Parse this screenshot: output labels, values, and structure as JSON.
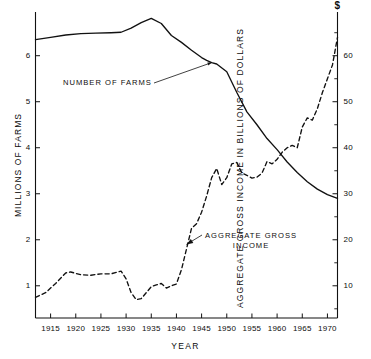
{
  "chart_data": {
    "type": "line",
    "title": "",
    "subtitle": "",
    "xlabel": "YEAR",
    "ylabel": "MILLIONS OF FARMS",
    "ylabel_right": "AGGREGATE GROSS INCOME IN BILLIONS OF DOLLARS",
    "right_axis_unit_symbol": "$",
    "grid": false,
    "legend_position": "inline-annotations",
    "xlim": [
      1912,
      1972
    ],
    "ylim": [
      0.3,
      6.95
    ],
    "ylim_right": [
      3.0,
      69.5
    ],
    "xticks": [
      1915,
      1920,
      1925,
      1930,
      1935,
      1940,
      1945,
      1950,
      1955,
      1960,
      1965,
      1970
    ],
    "xtick_labels": [
      "1915",
      "1920",
      "1925",
      "1930",
      "1935",
      "1940",
      "1945",
      "1950",
      "1955",
      "1960",
      "1965",
      "1970"
    ],
    "yticks_left": [
      1,
      2,
      3,
      4,
      5,
      6
    ],
    "ytick_labels_left": [
      "1",
      "2",
      "3",
      "4",
      "5",
      "6"
    ],
    "yticks_right": [
      10,
      20,
      30,
      40,
      50,
      60
    ],
    "ytick_labels_right": [
      "10",
      "20",
      "30",
      "40",
      "50",
      "60"
    ],
    "yticks_right_minor": [
      5,
      15,
      25,
      35,
      45,
      55,
      65
    ],
    "series": [
      {
        "name": "NUMBER OF FARMS",
        "axis": "left",
        "style": "solid",
        "color": "#111111",
        "x": [
          1912,
          1915,
          1918,
          1921,
          1924,
          1927,
          1929,
          1931,
          1933,
          1935,
          1937,
          1939,
          1941,
          1943,
          1945,
          1946,
          1947,
          1948,
          1950,
          1952,
          1954,
          1956,
          1958,
          1960,
          1962,
          1964,
          1966,
          1968,
          1970,
          1972
        ],
        "y": [
          6.35,
          6.4,
          6.45,
          6.48,
          6.49,
          6.5,
          6.51,
          6.6,
          6.72,
          6.81,
          6.7,
          6.44,
          6.29,
          6.12,
          5.96,
          5.9,
          5.85,
          5.82,
          5.65,
          5.2,
          4.78,
          4.5,
          4.2,
          3.96,
          3.69,
          3.46,
          3.26,
          3.1,
          2.98,
          2.9
        ]
      },
      {
        "name": "AGGREGATE GROSS INCOME",
        "axis": "right",
        "style": "dashed",
        "color": "#111111",
        "x": [
          1912,
          1914,
          1916,
          1918,
          1919,
          1921,
          1923,
          1925,
          1927,
          1929,
          1930,
          1931,
          1932,
          1933,
          1935,
          1936,
          1937,
          1938,
          1939,
          1940,
          1941,
          1942,
          1943,
          1944,
          1945,
          1946,
          1947,
          1948,
          1949,
          1950,
          1951,
          1952,
          1953,
          1954,
          1955,
          1956,
          1957,
          1958,
          1959,
          1960,
          1961,
          1962,
          1963,
          1964,
          1965,
          1966,
          1967,
          1968,
          1969,
          1970,
          1971,
          1972
        ],
        "y": [
          7.5,
          8.5,
          10.5,
          12.8,
          13.0,
          12.4,
          12.3,
          12.6,
          12.6,
          13.2,
          11.5,
          8.5,
          7.0,
          7.2,
          9.8,
          10.2,
          10.5,
          9.5,
          10.0,
          10.4,
          13.5,
          18.0,
          22.5,
          23.5,
          26.0,
          29.5,
          33.5,
          35.5,
          32.0,
          33.5,
          36.5,
          36.8,
          34.5,
          34.0,
          33.4,
          33.6,
          34.5,
          37.0,
          36.5,
          37.5,
          39.0,
          40.0,
          40.5,
          40.0,
          44.5,
          46.5,
          46.0,
          48.5,
          52.0,
          55.0,
          58.0,
          64.0
        ]
      }
    ],
    "annotations": [
      {
        "id": "number-of-farms-annotation",
        "text": "NUMBER OF FARMS",
        "line1": "NUMBER OF FARMS",
        "line2": "",
        "points_to_year": 1947,
        "points_to_value": 5.85
      },
      {
        "id": "aggregate-gross-income-annotation",
        "text": "AGGREGATE GROSS INCOME",
        "line1": "AGGREGATE GROSS",
        "line2": "INCOME",
        "points_to_year": 1942,
        "points_to_value": 19.0
      }
    ]
  }
}
